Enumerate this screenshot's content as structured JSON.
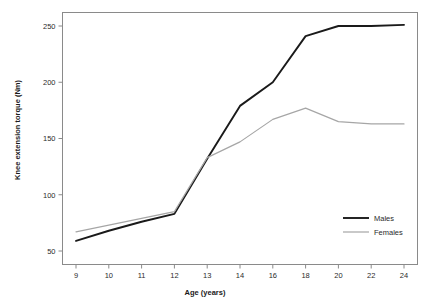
{
  "chart_data": {
    "type": "line",
    "title": "",
    "xlabel": "Age (years)",
    "ylabel": "Knee extension torque (Nm)",
    "x": [
      9,
      10,
      11,
      12,
      13,
      14,
      16,
      18,
      20,
      22,
      24
    ],
    "categories": [
      "9",
      "10",
      "11",
      "12",
      "13",
      "14",
      "16",
      "18",
      "20",
      "22",
      "24"
    ],
    "xtick_labels": [
      "9",
      "10",
      "11",
      "12",
      "13",
      "14",
      "16",
      "18",
      "20",
      "22",
      "24"
    ],
    "ytick_labels": [
      "50",
      "100",
      "150",
      "200",
      "250"
    ],
    "yticks": [
      50,
      100,
      150,
      200,
      250
    ],
    "ylim": [
      38,
      262
    ],
    "grid": false,
    "legend_position": "bottom-right",
    "axis_spacing": "categorical",
    "series": [
      {
        "name": "Males",
        "color": "#1a1a1a",
        "values": [
          59,
          68,
          76,
          83,
          132,
          179,
          200,
          241,
          250,
          250,
          251
        ]
      },
      {
        "name": "Females",
        "color": "#a6a6a6",
        "values": [
          67,
          73,
          79,
          85,
          133,
          147,
          167,
          177,
          165,
          163,
          163
        ]
      }
    ]
  },
  "axes": {
    "x_axis_title": "Age (years)",
    "y_axis_title": "Knee extension torque (Nm)"
  },
  "legend": {
    "entries": [
      {
        "label": "Males",
        "color": "#1a1a1a",
        "width": 1.9
      },
      {
        "label": "Females",
        "color": "#a6a6a6",
        "width": 1.2
      }
    ]
  }
}
